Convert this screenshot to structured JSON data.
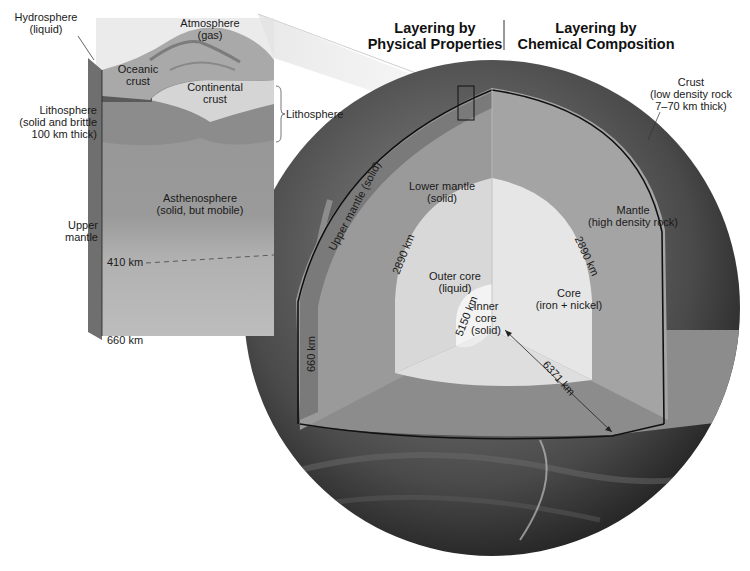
{
  "headings": {
    "physical": [
      "Layering by",
      "Physical Properties"
    ],
    "chemical": [
      "Layering by",
      "Chemical Composition"
    ]
  },
  "block": {
    "hydrosphere": [
      "Hydrosphere",
      "(liquid)"
    ],
    "atmosphere": [
      "Atmosphere",
      "(gas)"
    ],
    "oceanic_crust": [
      "Oceanic",
      "crust"
    ],
    "continental_crust": [
      "Continental",
      "crust"
    ],
    "lithosphere_left": [
      "Lithosphere",
      "(solid and brittle",
      "100 km thick)"
    ],
    "lithosphere_bracket": "Lithosphere",
    "asthenosphere": [
      "Asthenosphere",
      "(solid, but mobile)"
    ],
    "upper_mantle": [
      "Upper",
      "mantle"
    ],
    "depth_410": "410 km",
    "depth_660": "660 km"
  },
  "globe": {
    "crust": [
      "Crust",
      "(low density rock",
      "7–70 km thick)"
    ],
    "upper_mantle_solid": "Upper mantle (solid)",
    "lower_mantle": [
      "Lower mantle",
      "(solid)"
    ],
    "mantle": [
      "Mantle",
      "(high density rock)"
    ],
    "outer_core": [
      "Outer core",
      "(liquid)"
    ],
    "core": [
      "Core",
      "(iron + nickel)"
    ],
    "inner_core": [
      "Inner",
      "core",
      "(solid)"
    ],
    "depth_660": "660 km",
    "depth_2890_left": "2890 km",
    "depth_2890_right": "2890 km",
    "depth_5150": "5150 km",
    "radius_6371": "6371 km"
  },
  "colors": {
    "surface_dark": "#3a3a3a",
    "crust_band": "#6e6e6e",
    "upper_mantle": "#7c7c7c",
    "lower_mantle": "#9a9a9a",
    "mantle_chem": "#a3a3a3",
    "outer_core": "#d9d9d9",
    "core_chem": "#e6e6e6",
    "inner_core": "#f2f2f2",
    "cut_floor": "#8f8f8f",
    "block_asthenosphere": "#9b9b9b",
    "block_lower": "#b4b4b4",
    "block_litho": "#8a8a8a",
    "block_continental": "#d6d6d6"
  }
}
